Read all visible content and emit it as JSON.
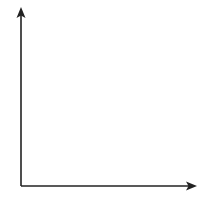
{
  "chart_data": {
    "type": "grid",
    "title": "",
    "xlabel": "x",
    "ylabel": "y",
    "x_ticks": [
      "0",
      "1",
      "2",
      "3",
      "4",
      "5",
      "6"
    ],
    "y_ticks": [
      "0",
      "1",
      "2",
      "3",
      "4",
      "5",
      "6"
    ],
    "xlim": [
      0,
      6.5
    ],
    "ylim": [
      0,
      6.5
    ],
    "grid": true,
    "series": []
  },
  "colors": {
    "axis": "#222222",
    "grid": "#b8b8b8",
    "text": "#333333"
  }
}
